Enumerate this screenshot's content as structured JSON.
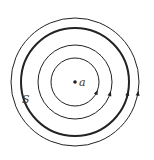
{
  "diagram": {
    "type": "concentric-field-lines",
    "center": {
      "x": 75,
      "y": 82
    },
    "center_label": "a",
    "surface_label": "S",
    "circles": [
      {
        "r": 24,
        "stroke_width": 1.0,
        "arrow_angle_deg": 25
      },
      {
        "r": 37,
        "stroke_width": 1.0,
        "arrow_angle_deg": 18
      },
      {
        "r": 54,
        "stroke_width": 2.0,
        "arrow_angle_deg": 12,
        "label": "S"
      },
      {
        "r": 64,
        "stroke_width": 1.0,
        "arrow_angle_deg": 10
      }
    ],
    "arrow_direction": "counterclockwise",
    "colors": {
      "line": "#222222",
      "background": "#ffffff"
    }
  }
}
